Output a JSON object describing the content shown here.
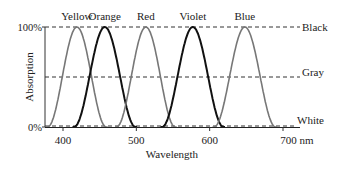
{
  "chart_data": {
    "type": "line",
    "title": "",
    "xlabel": "Wavelength",
    "ylabel": "Absorption",
    "x_unit": "nm",
    "xlim": [
      375,
      720
    ],
    "ylim": [
      0,
      100
    ],
    "x_ticks": [
      400,
      500,
      600,
      700
    ],
    "x_tick_labels": [
      "400",
      "500",
      "600",
      "700 nm"
    ],
    "y_ticks": [
      0,
      100
    ],
    "y_tick_labels": [
      "0%",
      "100%"
    ],
    "grid": false,
    "reference_lines": [
      {
        "y": 100,
        "label": "Black",
        "style": "dashed"
      },
      {
        "y": 50,
        "label": "Gray",
        "style": "dashed"
      },
      {
        "y": 0,
        "label": "White",
        "style": "dashed"
      }
    ],
    "series": [
      {
        "name": "Yellow",
        "color": "#777777",
        "peak_nm": 419,
        "width_nm": 40,
        "peak_value": 100
      },
      {
        "name": "Orange",
        "color": "#111111",
        "peak_nm": 457,
        "width_nm": 42,
        "peak_value": 100
      },
      {
        "name": "Red",
        "color": "#777777",
        "peak_nm": 513,
        "width_nm": 40,
        "peak_value": 100
      },
      {
        "name": "Violet",
        "color": "#111111",
        "peak_nm": 577,
        "width_nm": 42,
        "peak_value": 100
      },
      {
        "name": "Blue",
        "color": "#777777",
        "peak_nm": 648,
        "width_nm": 42,
        "peak_value": 100
      }
    ],
    "legend_position": "labels above each peak"
  }
}
